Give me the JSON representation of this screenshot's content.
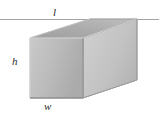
{
  "figure": {
    "name": "rectangular-box-dimensions-diagram",
    "background_color": "#ffffff",
    "shape": "rectangular box (cuboid) in oblique 3D view",
    "labels": {
      "length": "l",
      "height": "h",
      "width": "w"
    },
    "reference_line": {
      "orientation": "horizontal",
      "y": 19,
      "x_start": 0,
      "x_end": 159,
      "color": "#9a9a9a"
    },
    "colors": {
      "front_face": "#b9b9b9",
      "top_face": "#a9a9a9",
      "right_face": "#c2c2c2",
      "interior_back": "#b2b2b2",
      "edge_light": "#e8e8e8",
      "edge_dark": "#7a7a7a",
      "outline": "#8c8c8c",
      "label_text": "#2b2b2b"
    },
    "geometry": {
      "front_face": [
        [
          30,
          38
        ],
        [
          83,
          38
        ],
        [
          83,
          98
        ],
        [
          30,
          98
        ]
      ],
      "top_face": [
        [
          30,
          38
        ],
        [
          83,
          38
        ],
        [
          137,
          19
        ],
        [
          90,
          19
        ]
      ],
      "right_face": [
        [
          83,
          38
        ],
        [
          137,
          19
        ],
        [
          137,
          80
        ],
        [
          83,
          98
        ]
      ]
    }
  }
}
